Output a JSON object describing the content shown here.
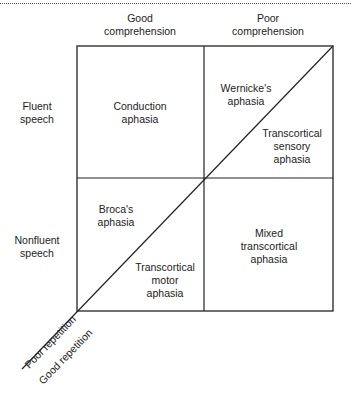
{
  "columns": [
    {
      "label_line1": "Good",
      "label_line2": "comprehension"
    },
    {
      "label_line1": "Poor",
      "label_line2": "comprehension"
    }
  ],
  "rows": [
    {
      "label_line1": "Fluent",
      "label_line2": "speech"
    },
    {
      "label_line1": "Nonfluent",
      "label_line2": "speech"
    }
  ],
  "cells": {
    "conduction": {
      "line1": "Conduction",
      "line2": "aphasia"
    },
    "wernicke": {
      "line1": "Wernicke's",
      "line2": "aphasia"
    },
    "transcortical_sensory": {
      "line1": "Transcortical",
      "line2": "sensory",
      "line3": "aphasia"
    },
    "broca": {
      "line1": "Broca's",
      "line2": "aphasia"
    },
    "transcortical_motor": {
      "line1": "Transcortical",
      "line2": "motor",
      "line3": "aphasia"
    },
    "mixed_transcortical": {
      "line1": "Mixed",
      "line2": "transcortical",
      "line3": "aphasia"
    }
  },
  "diagonal_axis": {
    "upper_label": "Poor repetition",
    "lower_label": "Good repetition"
  },
  "colors": {
    "line": "#222222",
    "background": "#ffffff"
  }
}
